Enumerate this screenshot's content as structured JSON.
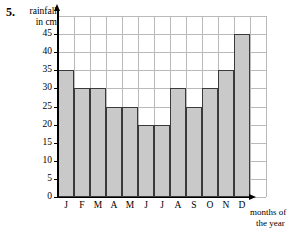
{
  "question": {
    "number": "5."
  },
  "axis_titles": {
    "y_line1": "rainfall",
    "y_line2": "in cm",
    "x_line1": "months of",
    "x_line2": "the year"
  },
  "y_ticks": [
    "0",
    "5",
    "10",
    "15",
    "20",
    "25",
    "30",
    "35",
    "40",
    "45"
  ],
  "x_ticks": [
    "J",
    "F",
    "M",
    "A",
    "M",
    "J",
    "J",
    "A",
    "S",
    "O",
    "N",
    "D"
  ],
  "colors": {
    "bar_fill": "#c9c9c9",
    "bar_stroke": "#3a3a3a",
    "gridline": "#b9b9b9",
    "axis": "#000000",
    "text": "#000000",
    "background": "#ffffff"
  },
  "chart_data": {
    "type": "bar",
    "title": "",
    "xlabel": "months of the year",
    "ylabel": "rainfall in cm",
    "categories": [
      "J",
      "F",
      "M",
      "A",
      "M",
      "J",
      "J",
      "A",
      "S",
      "O",
      "N",
      "D"
    ],
    "category_names": [
      "January",
      "February",
      "March",
      "April",
      "May",
      "June",
      "July",
      "August",
      "September",
      "October",
      "November",
      "December"
    ],
    "values": [
      35,
      30,
      30,
      25,
      25,
      20,
      20,
      30,
      25,
      30,
      35,
      45
    ],
    "ylim": [
      0,
      45
    ],
    "ytick_step": 5,
    "yticks": [
      0,
      5,
      10,
      15,
      20,
      25,
      30,
      35,
      40,
      45
    ],
    "grid": true,
    "legend": "none",
    "units": "cm"
  }
}
